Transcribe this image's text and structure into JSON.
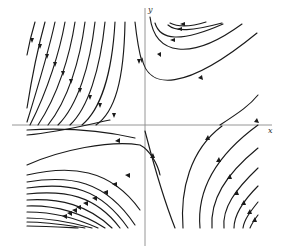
{
  "diagram": {
    "type": "phase-portrait",
    "axes": {
      "x_label": "x",
      "y_label": "y",
      "origin_px": [
        145,
        125
      ]
    },
    "colors": {
      "background": "#ffffff",
      "trajectory": "#1a1a1a",
      "axis": "#8a8a8a"
    },
    "regions": [
      {
        "name": "upper-left",
        "flow": "trajectories descend steeply toward the lower-left"
      },
      {
        "name": "upper-right",
        "flow": "U-shaped trajectories opening upward-right, moving right"
      },
      {
        "name": "lower-left",
        "flow": "trajectories fanning leftward, moving toward upper-left"
      },
      {
        "name": "lower-right",
        "flow": "trajectories curving upward-right, moving toward upper-right"
      }
    ]
  }
}
